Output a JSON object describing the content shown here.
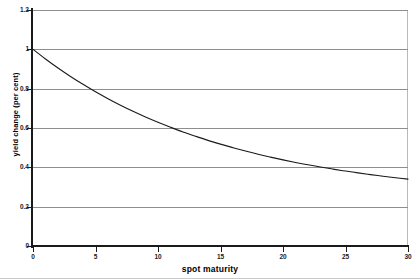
{
  "chart_data": {
    "type": "line",
    "title": "",
    "subtitle": "",
    "xlabel": "spot maturity",
    "ylabel": "yield change (per cent)",
    "xlim": [
      0,
      30
    ],
    "ylim": [
      0,
      1.2
    ],
    "grid": "horizontal",
    "legend": "none",
    "x_ticks": [
      0,
      5,
      10,
      15,
      20,
      25,
      30
    ],
    "x_tick_labels": [
      "0",
      "5",
      "10",
      "15",
      "20",
      "25",
      "30"
    ],
    "y_ticks": [
      0,
      0.2,
      0.4,
      0.6,
      0.8,
      1,
      1.2
    ],
    "y_tick_labels": [
      "0",
      "0.2",
      "0.4",
      "0.6",
      "0.8",
      "1",
      "1.2"
    ],
    "series": [
      {
        "name": "yield change",
        "color": "#1a1a1a",
        "x": [
          0,
          1,
          2,
          3,
          4,
          5,
          6,
          7,
          8,
          9,
          10,
          11,
          12,
          13,
          14,
          15,
          16,
          17,
          18,
          19,
          20,
          21,
          22,
          23,
          24,
          25,
          26,
          27,
          28,
          29,
          30
        ],
        "y": [
          1.0,
          0.951,
          0.905,
          0.862,
          0.822,
          0.784,
          0.749,
          0.716,
          0.685,
          0.656,
          0.629,
          0.604,
          0.58,
          0.558,
          0.537,
          0.518,
          0.5,
          0.483,
          0.467,
          0.452,
          0.438,
          0.425,
          0.413,
          0.402,
          0.391,
          0.381,
          0.372,
          0.363,
          0.355,
          0.347,
          0.34
        ]
      }
    ]
  },
  "axes": {
    "y_title": "yield change (per cent)",
    "x_title": "spot maturity"
  }
}
